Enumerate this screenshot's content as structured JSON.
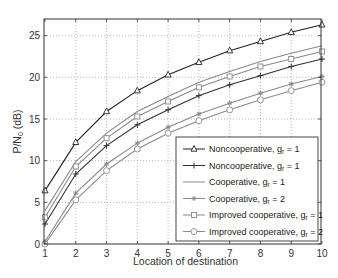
{
  "chart_data": {
    "type": "line",
    "title": "",
    "xlabel": "Location of destination",
    "ylabel": "P/N0 (dB)",
    "ylabel_main": "P/N",
    "ylabel_sub": "0",
    "ylabel_unit": " (dB)",
    "xlim": [
      1,
      10
    ],
    "ylim": [
      0,
      27
    ],
    "x_ticks": [
      1,
      2,
      3,
      4,
      5,
      6,
      7,
      8,
      9,
      10
    ],
    "y_ticks": [
      0,
      5,
      10,
      15,
      20,
      25
    ],
    "grid": true,
    "legend_position": "lower right",
    "x": [
      1,
      2,
      3,
      4,
      5,
      6,
      7,
      8,
      9,
      10
    ],
    "series": [
      {
        "name": "Noncooperative, gr = 1",
        "label_main": "Noncooperative, g",
        "label_sub": "r",
        "label_tail": " = 1",
        "marker": "triangle",
        "color": "#222222",
        "values": [
          6.4,
          12.2,
          15.9,
          18.4,
          20.3,
          21.8,
          23.2,
          24.3,
          25.4,
          26.3
        ]
      },
      {
        "name": "Noncooperative, gr = 1",
        "label_main": "Noncooperative, g",
        "label_sub": "r",
        "label_tail": " = 1",
        "marker": "plus",
        "color": "#333333",
        "values": [
          2.4,
          8.4,
          11.8,
          14.3,
          16.1,
          17.8,
          19.1,
          20.2,
          21.3,
          22.2
        ]
      },
      {
        "name": "Cooperative, gr = 1",
        "label_main": "Cooperative, g",
        "label_sub": "r",
        "label_tail": " = 1",
        "marker": "none",
        "color": "#8a8a8a",
        "values": [
          4.0,
          9.9,
          13.3,
          15.9,
          17.7,
          19.4,
          20.7,
          21.9,
          22.9,
          23.8
        ]
      },
      {
        "name": "Cooperative, gr = 2",
        "label_main": "Cooperative, g",
        "label_sub": "r",
        "label_tail": " = 2",
        "marker": "star",
        "color": "#8a8a8a",
        "values": [
          0.3,
          6.1,
          9.6,
          12.1,
          14.0,
          15.6,
          16.9,
          18.1,
          19.2,
          20.1
        ]
      },
      {
        "name": "Improved cooperative, gr = 1",
        "label_main": "Improved cooperative, g",
        "label_sub": "r",
        "label_tail": " = 1",
        "marker": "square",
        "color": "#8a8a8a",
        "values": [
          3.2,
          9.3,
          12.7,
          15.3,
          17.1,
          18.8,
          20.1,
          21.3,
          22.2,
          23.1
        ]
      },
      {
        "name": "Improved cooperative, gr = 2",
        "label_main": "Improved cooperative, g",
        "label_sub": "r",
        "label_tail": " = 2",
        "marker": "circle",
        "color": "#8a8a8a",
        "values": [
          0.0,
          5.3,
          8.8,
          11.4,
          13.3,
          14.8,
          16.1,
          17.3,
          18.4,
          19.4
        ]
      }
    ]
  }
}
